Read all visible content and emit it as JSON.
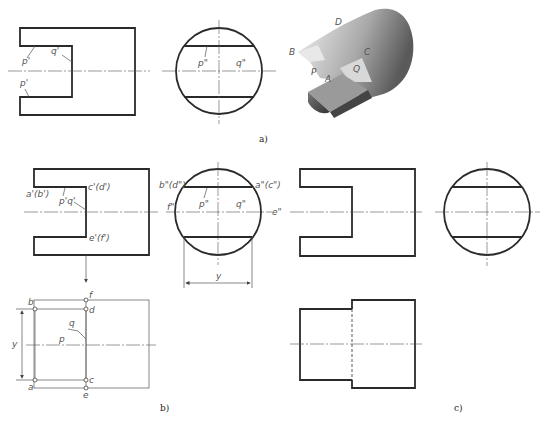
{
  "figure": {
    "panels": [
      {
        "id": "a",
        "caption": "a)"
      },
      {
        "id": "b",
        "caption": "b)"
      },
      {
        "id": "c",
        "caption": "c)"
      }
    ]
  },
  "panel_a": {
    "front_labels": {
      "p_top": "p'",
      "q": "q'",
      "p_bottom": "p'"
    },
    "side_labels": {
      "p": "p\"",
      "q": "q\""
    },
    "iso_labels": {
      "D": "D",
      "B": "B",
      "C": "C",
      "P": "P",
      "A": "A",
      "Q": "Q"
    }
  },
  "panel_b": {
    "front_labels": {
      "ab": "a'(b')",
      "pq": "p'q'",
      "cd": "c'(d')",
      "ef": "e'(f')"
    },
    "side_labels": {
      "bd": "b\"(d\")",
      "ac": "a\"(c\")",
      "f": "f\"",
      "e": "e\"",
      "p": "p\"",
      "q": "q\"",
      "dim": "y"
    },
    "top_labels": {
      "b": "b",
      "f": "f",
      "d": "d",
      "q": "q",
      "p": "p",
      "a": "a",
      "c": "c",
      "e": "e",
      "dim": "y"
    }
  },
  "colors": {
    "line": "#2a2a2a",
    "thin": "#555555",
    "background": "#ffffff"
  }
}
